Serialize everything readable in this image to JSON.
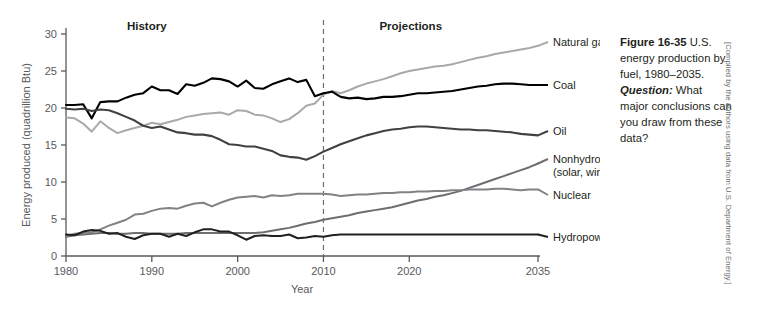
{
  "figure": {
    "number": "Figure 16-35",
    "caption_line1": " U.S. energy production by fuel, 1980–2035. ",
    "question_label": "Question:",
    "caption_line2": " What major conclusions can you draw from these data?",
    "credit": "[Compiled by the authors using data from U.S. Department of Energy.]"
  },
  "annotations": {
    "history": "History",
    "projections": "Projections",
    "divider_year": 2010
  },
  "chart_data": {
    "type": "line",
    "title": "U.S. energy production by fuel, 1980–2035",
    "xlabel": "Year",
    "ylabel": "Energy produced (quadrillion Btu)",
    "xlim": [
      1980,
      2035
    ],
    "ylim": [
      0,
      30
    ],
    "xticks": [
      1980,
      1990,
      2000,
      2010,
      2020,
      2035
    ],
    "yticks": [
      0,
      5,
      10,
      15,
      20,
      25,
      30
    ],
    "grid": false,
    "legend_position": "right-of-plot-inline",
    "x": [
      1980,
      1981,
      1982,
      1983,
      1984,
      1985,
      1986,
      1987,
      1988,
      1989,
      1990,
      1991,
      1992,
      1993,
      1994,
      1995,
      1996,
      1997,
      1998,
      1999,
      2000,
      2001,
      2002,
      2003,
      2004,
      2005,
      2006,
      2007,
      2008,
      2009,
      2010,
      2011,
      2012,
      2013,
      2014,
      2015,
      2016,
      2017,
      2018,
      2019,
      2020,
      2021,
      2022,
      2023,
      2024,
      2025,
      2026,
      2027,
      2028,
      2029,
      2030,
      2031,
      2032,
      2033,
      2034,
      2035
    ],
    "series": [
      {
        "name": "Natural gas",
        "color": "#a7a9ac",
        "width": 2.0,
        "values": [
          18.7,
          18.6,
          17.9,
          16.8,
          18.2,
          17.3,
          16.6,
          17.0,
          17.3,
          17.6,
          18.0,
          17.8,
          18.1,
          18.4,
          18.8,
          19.0,
          19.2,
          19.3,
          19.4,
          19.1,
          19.7,
          19.6,
          19.1,
          19.0,
          18.6,
          18.1,
          18.5,
          19.3,
          20.3,
          20.6,
          21.8,
          22.3,
          22.0,
          22.4,
          22.9,
          23.3,
          23.6,
          23.9,
          24.3,
          24.7,
          25.0,
          25.2,
          25.4,
          25.6,
          25.7,
          25.9,
          26.2,
          26.5,
          26.8,
          27.0,
          27.3,
          27.5,
          27.7,
          27.9,
          28.1,
          28.4
        ]
      },
      {
        "name": "Coal",
        "color": "#000000",
        "width": 2.1,
        "values": [
          20.4,
          20.4,
          20.5,
          18.6,
          20.8,
          20.9,
          20.9,
          21.4,
          21.8,
          22.0,
          22.9,
          22.4,
          22.4,
          21.9,
          23.2,
          23.0,
          23.4,
          24.0,
          23.9,
          23.6,
          22.9,
          23.7,
          22.7,
          22.6,
          23.2,
          23.6,
          24.0,
          23.5,
          23.8,
          21.6,
          22.0,
          22.2,
          21.5,
          21.3,
          21.4,
          21.2,
          21.3,
          21.5,
          21.5,
          21.6,
          21.8,
          22.0,
          22.0,
          22.1,
          22.2,
          22.3,
          22.5,
          22.7,
          22.9,
          23.0,
          23.2,
          23.3,
          23.3,
          23.2,
          23.1,
          23.1
        ]
      },
      {
        "name": "Oil",
        "color": "#414042",
        "width": 2.1,
        "values": [
          19.9,
          19.8,
          19.9,
          19.6,
          19.8,
          19.7,
          19.3,
          18.8,
          18.3,
          17.6,
          17.3,
          17.5,
          17.1,
          16.7,
          16.6,
          16.4,
          16.4,
          16.2,
          15.7,
          15.1,
          15.0,
          14.8,
          14.8,
          14.5,
          14.2,
          13.6,
          13.4,
          13.3,
          13.0,
          13.5,
          14.1,
          14.6,
          15.1,
          15.5,
          15.9,
          16.3,
          16.6,
          16.9,
          17.1,
          17.2,
          17.4,
          17.5,
          17.5,
          17.4,
          17.3,
          17.2,
          17.1,
          17.1,
          17.0,
          17.0,
          16.9,
          16.8,
          16.7,
          16.5,
          16.4,
          16.3
        ]
      },
      {
        "name": "Nonhydro renewables",
        "sublabel": "(solar, wind, biomass, geothermal)",
        "color": "#6d6e71",
        "width": 2.0,
        "values": [
          2.6,
          2.8,
          2.9,
          3.0,
          3.1,
          3.1,
          3.0,
          3.0,
          3.1,
          3.1,
          3.0,
          3.0,
          3.0,
          3.0,
          3.1,
          3.1,
          3.1,
          3.1,
          3.1,
          3.1,
          3.1,
          3.1,
          3.1,
          3.2,
          3.4,
          3.6,
          3.8,
          4.1,
          4.4,
          4.6,
          4.9,
          5.1,
          5.3,
          5.5,
          5.8,
          6.0,
          6.2,
          6.4,
          6.6,
          6.9,
          7.2,
          7.5,
          7.7,
          8.0,
          8.2,
          8.5,
          8.8,
          9.2,
          9.6,
          10.0,
          10.4,
          10.8,
          11.2,
          11.6,
          12.0,
          12.5
        ]
      },
      {
        "name": "Nuclear",
        "color": "#808285",
        "width": 2.0,
        "values": [
          2.7,
          3.0,
          3.1,
          3.2,
          3.6,
          4.1,
          4.5,
          4.9,
          5.6,
          5.7,
          6.1,
          6.4,
          6.5,
          6.4,
          6.8,
          7.1,
          7.2,
          6.7,
          7.2,
          7.6,
          7.9,
          8.0,
          8.1,
          7.9,
          8.2,
          8.1,
          8.2,
          8.4,
          8.4,
          8.4,
          8.4,
          8.3,
          8.1,
          8.2,
          8.3,
          8.3,
          8.4,
          8.5,
          8.5,
          8.6,
          8.6,
          8.7,
          8.7,
          8.8,
          8.8,
          8.9,
          8.9,
          9.0,
          9.0,
          9.0,
          9.1,
          9.1,
          9.0,
          8.9,
          9.0,
          9.0
        ]
      },
      {
        "name": "Hydropower",
        "color": "#231f20",
        "width": 2.0,
        "values": [
          2.9,
          2.8,
          3.3,
          3.5,
          3.4,
          3.0,
          3.1,
          2.6,
          2.3,
          2.8,
          3.0,
          3.0,
          2.6,
          3.0,
          2.7,
          3.2,
          3.6,
          3.6,
          3.3,
          3.3,
          2.8,
          2.2,
          2.7,
          2.8,
          2.7,
          2.7,
          2.9,
          2.4,
          2.5,
          2.7,
          2.6,
          2.8,
          2.9,
          2.9,
          2.9,
          2.9,
          2.9,
          2.9,
          2.9,
          2.9,
          2.9,
          2.9,
          2.9,
          2.9,
          2.9,
          2.9,
          2.9,
          2.9,
          2.9,
          2.9,
          2.9,
          2.9,
          2.9,
          2.9,
          2.9,
          2.9
        ]
      }
    ],
    "series_label_y": {
      "Natural gas": 46,
      "Coal": 89,
      "Oil": 135,
      "Nonhydro renewables": 163,
      "Nuclear": 199,
      "Hydropower": 241
    }
  }
}
